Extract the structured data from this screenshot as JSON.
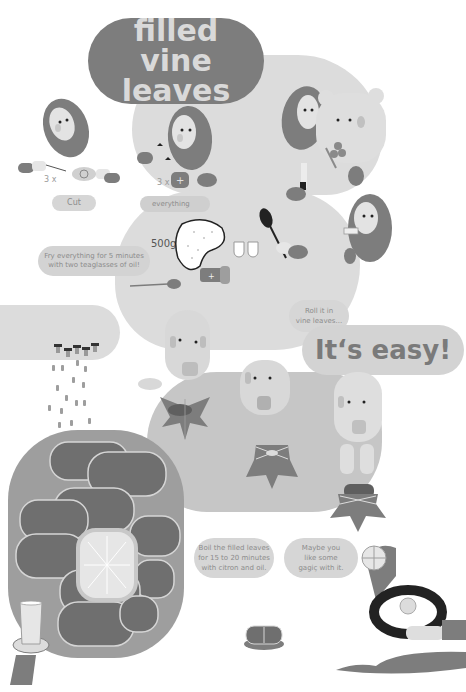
{
  "title": {
    "line1": "filled",
    "line2": "vine leaves"
  },
  "steps": {
    "cut_label": "Cut",
    "cut_count": "3 x",
    "everything_label": "everything",
    "everything_count": "3 x",
    "fry_line1": "Fry everything for 5 minutes",
    "fry_line2": "with two teaglasses of oil!",
    "rice_amount": "500g",
    "roll_line1": "Roll it in",
    "roll_line2": "vine leaves...",
    "easy_label": "It‘s easy!",
    "boil_line1": "Boil the filled leaves",
    "boil_line2": "for 15 to 20 minutes",
    "boil_line3": "with citron and oil.",
    "gagic_line1": "Maybe you",
    "gagic_line2": "like some",
    "gagic_line3": "gagiç with it."
  },
  "illustrations": [
    "woman-in-headscarf-cutting",
    "woman-in-headscarf-with-salt",
    "woman-in-headscarf-watching",
    "bear-with-herbs",
    "rice-bag",
    "tea-glasses",
    "spoon-stirring",
    "woman-tasting",
    "salt-shaker",
    "man-with-spices",
    "men-rolling-leaves",
    "vine-leaf-stars",
    "pot-with-rolled-leaves",
    "citron-slice",
    "tea-glass",
    "bowl-of-gagic",
    "plate-of-dolma",
    "serving-spoon"
  ],
  "colors": {
    "background": "#ffffff",
    "dark_gray": "#7d7d7d",
    "mid_gray": "#9e9e9e",
    "light_gray": "#dcdcdc",
    "text_gray": "#8c8c8c",
    "black": "#222222"
  }
}
